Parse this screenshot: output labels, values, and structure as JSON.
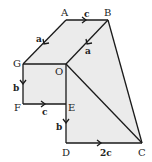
{
  "diagram": {
    "vertices": {
      "A": {
        "label": "A",
        "x": 66,
        "y": 20
      },
      "B": {
        "label": "B",
        "x": 108,
        "y": 20
      },
      "G": {
        "label": "G",
        "x": 23,
        "y": 64
      },
      "O": {
        "label": "O",
        "x": 66,
        "y": 64
      },
      "F": {
        "label": "F",
        "x": 23,
        "y": 104
      },
      "E": {
        "label": "E",
        "x": 66,
        "y": 104
      },
      "D": {
        "label": "D",
        "x": 66,
        "y": 143
      },
      "C": {
        "label": "C",
        "x": 142,
        "y": 143
      }
    },
    "vectors": {
      "AB": "c",
      "AG": "a",
      "BO": "a",
      "GF": "b",
      "FE": "c",
      "ED": "b",
      "DC": "2c"
    },
    "colors": {
      "fill": "#ebebeb",
      "stroke": "#1a1a1a"
    }
  }
}
